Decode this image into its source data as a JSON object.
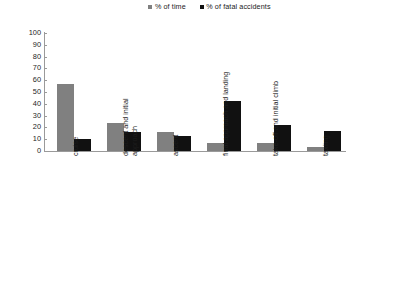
{
  "chart_data": {
    "type": "bar",
    "title": "",
    "subtitle": "",
    "xlabel": "",
    "ylabel": "",
    "ylim": [
      0,
      100
    ],
    "ytick_step": 10,
    "yticks": [
      "100",
      "90",
      "80",
      "70",
      "60",
      "50",
      "40",
      "30",
      "20",
      "10",
      "0"
    ],
    "grid": false,
    "legend_position": "top-center",
    "categories": [
      "cruise",
      "descent and initial\napproach",
      "ascent",
      "final approach and landing",
      "take-off and initial climb",
      "taxiing"
    ],
    "series": [
      {
        "name": "% of time",
        "color": "#808080",
        "values": [
          57,
          24,
          16,
          7,
          7,
          3
        ]
      },
      {
        "name": "% of fatal accidents",
        "color": "#111111",
        "values": [
          10,
          16,
          13,
          42,
          22,
          17
        ]
      }
    ]
  },
  "legend": {
    "items": [
      {
        "label": "% of time",
        "color": "#808080"
      },
      {
        "label": "% of fatal accidents",
        "color": "#111111"
      }
    ]
  },
  "axis": {
    "y_tick_labels": [
      "100",
      "90",
      "80",
      "70",
      "60",
      "50",
      "40",
      "30",
      "20",
      "10",
      "0"
    ],
    "x_tick_labels": [
      "cruise",
      "descent and initial\napproach",
      "ascent",
      "final approach and landing",
      "take-off and initial climb",
      "taxiing"
    ]
  }
}
